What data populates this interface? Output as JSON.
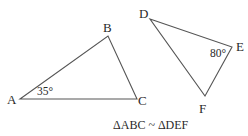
{
  "diagram": {
    "triangle_abc": {
      "vertices": {
        "A": {
          "label": "A",
          "x": 20,
          "y": 99
        },
        "B": {
          "label": "B",
          "x": 108,
          "y": 36
        },
        "C": {
          "label": "C",
          "x": 137,
          "y": 99
        }
      },
      "angle_label": "35°"
    },
    "triangle_def": {
      "vertices": {
        "D": {
          "label": "D",
          "x": 150,
          "y": 19
        },
        "E": {
          "label": "E",
          "x": 232,
          "y": 47
        },
        "F": {
          "label": "F",
          "x": 205,
          "y": 96
        }
      },
      "angle_label": "80°"
    },
    "caption": "ΔABC ~ ΔDEF",
    "line_color": "#555555",
    "text_color": "#2a2a2a"
  }
}
